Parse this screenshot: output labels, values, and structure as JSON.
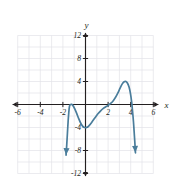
{
  "figure": {
    "name": "polynomial-graph",
    "axis_label_x": "x",
    "axis_label_y": "y",
    "curve_color": "#4a7d9b",
    "axis_color": "#231f20",
    "grid_color": "#e3e3e8",
    "background_color": "#ffffff"
  },
  "chart_data": {
    "type": "line",
    "title": "",
    "xlabel": "x",
    "ylabel": "y",
    "xlim": [
      -6.6,
      6.6
    ],
    "ylim": [
      -12.8,
      12.8
    ],
    "grid": true,
    "legend": false,
    "x_ticks": [
      -6,
      -4,
      -2,
      2,
      4,
      6
    ],
    "x_tick_labels": [
      "-6",
      "-4",
      "-2",
      "2",
      "4",
      "6"
    ],
    "y_ticks": [
      -12,
      -8,
      -4,
      4,
      8,
      12
    ],
    "y_tick_labels": [
      "-12",
      "-8",
      "-4",
      "4",
      "8",
      "12"
    ],
    "grid_step_x": 1,
    "grid_step_y": 2,
    "series": [
      {
        "name": "quintic-polynomial",
        "color": "#4a7d9b",
        "arrow_start": true,
        "arrow_end": true,
        "points": [
          [
            -1.72,
            -8.8
          ],
          [
            -1.66,
            -7.0
          ],
          [
            -1.6,
            -5.0
          ],
          [
            -1.54,
            -3.0
          ],
          [
            -1.48,
            -1.4
          ],
          [
            -1.42,
            -0.35
          ],
          [
            -1.34,
            -0.02
          ],
          [
            -1.22,
            0.02
          ],
          [
            -1.1,
            -0.2
          ],
          [
            -0.95,
            -0.75
          ],
          [
            -0.78,
            -1.55
          ],
          [
            -0.6,
            -2.45
          ],
          [
            -0.42,
            -3.25
          ],
          [
            -0.24,
            -3.8
          ],
          [
            -0.08,
            -4.0
          ],
          [
            0.1,
            -3.98
          ],
          [
            0.28,
            -3.75
          ],
          [
            0.46,
            -3.35
          ],
          [
            0.66,
            -2.8
          ],
          [
            0.88,
            -2.2
          ],
          [
            1.1,
            -1.62
          ],
          [
            1.34,
            -1.1
          ],
          [
            1.58,
            -0.68
          ],
          [
            1.82,
            -0.36
          ],
          [
            2.02,
            -0.12
          ],
          [
            2.22,
            0.18
          ],
          [
            2.44,
            0.62
          ],
          [
            2.66,
            1.25
          ],
          [
            2.88,
            2.05
          ],
          [
            3.06,
            2.85
          ],
          [
            3.24,
            3.55
          ],
          [
            3.42,
            3.95
          ],
          [
            3.58,
            4.0
          ],
          [
            3.72,
            3.7
          ],
          [
            3.86,
            3.0
          ],
          [
            3.98,
            1.9
          ],
          [
            4.08,
            0.5
          ],
          [
            4.16,
            -1.1
          ],
          [
            4.24,
            -2.9
          ],
          [
            4.3,
            -4.6
          ],
          [
            4.36,
            -6.4
          ],
          [
            4.42,
            -8.4
          ]
        ],
        "features": {
          "local_max_left": [
            -1.28,
            0.0
          ],
          "local_min": [
            0.0,
            -4.0
          ],
          "local_max_right": [
            3.55,
            4.0
          ],
          "x_intercepts": [
            -1.28,
            2.1,
            4.1
          ],
          "y_intercept": -4.0,
          "end_behavior_left": "down",
          "end_behavior_right": "down"
        }
      }
    ]
  }
}
